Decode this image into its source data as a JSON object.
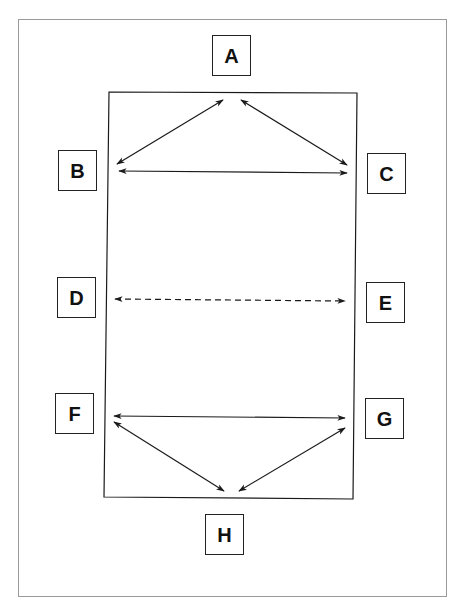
{
  "diagram": {
    "type": "communication-network",
    "colors": {
      "line": "#1a1a1a",
      "frame": "#9a9a9a",
      "background": "#ffffff"
    },
    "nodes": [
      {
        "id": "A",
        "label": "A",
        "x": 212,
        "y": 35
      },
      {
        "id": "B",
        "label": "B",
        "x": 58,
        "y": 150
      },
      {
        "id": "C",
        "label": "C",
        "x": 367,
        "y": 153
      },
      {
        "id": "D",
        "label": "D",
        "x": 57,
        "y": 277
      },
      {
        "id": "E",
        "label": "E",
        "x": 366,
        "y": 282
      },
      {
        "id": "F",
        "label": "F",
        "x": 55,
        "y": 393
      },
      {
        "id": "G",
        "label": "G",
        "x": 365,
        "y": 398
      },
      {
        "id": "H",
        "label": "H",
        "x": 205,
        "y": 514
      }
    ],
    "edges": [
      {
        "from": "A",
        "to": "B",
        "style": "solid",
        "bidirectional": true
      },
      {
        "from": "A",
        "to": "C",
        "style": "solid",
        "bidirectional": true
      },
      {
        "from": "B",
        "to": "C",
        "style": "solid",
        "bidirectional": true
      },
      {
        "from": "D",
        "to": "E",
        "style": "dashed",
        "bidirectional": true
      },
      {
        "from": "F",
        "to": "G",
        "style": "solid",
        "bidirectional": true
      },
      {
        "from": "F",
        "to": "H",
        "style": "solid",
        "bidirectional": true
      },
      {
        "from": "G",
        "to": "H",
        "style": "solid",
        "bidirectional": true
      }
    ],
    "inner_rect": [
      [
        109,
        92
      ],
      [
        357,
        93
      ],
      [
        353,
        499
      ],
      [
        104,
        497
      ]
    ]
  }
}
